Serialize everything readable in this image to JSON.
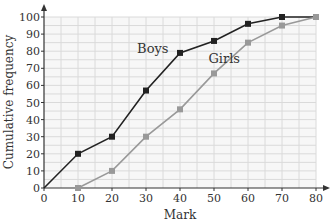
{
  "chart_data": {
    "type": "line",
    "title": "",
    "xlabel": "Mark",
    "ylabel": "Cumulative frequency",
    "xlim": [
      0,
      80
    ],
    "ylim": [
      0,
      100
    ],
    "x_ticks": [
      0,
      10,
      20,
      30,
      40,
      50,
      60,
      70,
      80
    ],
    "y_ticks": [
      0,
      10,
      20,
      30,
      40,
      50,
      60,
      70,
      80,
      90,
      100
    ],
    "grid": true,
    "grid_minor_step": 5,
    "legend": "inline labels",
    "series": [
      {
        "name": "Boys",
        "color": "#222222",
        "marker": "square",
        "x": [
          0,
          10,
          20,
          30,
          40,
          50,
          60,
          70,
          80
        ],
        "values": [
          0,
          20,
          30,
          57,
          79,
          86,
          96,
          100,
          100
        ],
        "label_pos": [
          32,
          79
        ]
      },
      {
        "name": "Girls",
        "color": "#999999",
        "marker": "square",
        "x": [
          10,
          20,
          30,
          40,
          50,
          60,
          70,
          80
        ],
        "values": [
          0,
          10,
          30,
          46,
          67,
          85,
          95,
          100
        ],
        "label_pos": [
          53,
          73
        ]
      }
    ]
  }
}
